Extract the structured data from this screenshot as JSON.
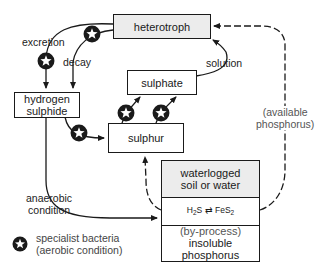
{
  "diagram": {
    "type": "sulphur cycle flow diagram",
    "nodes": {
      "heterotroph": "heterotroph",
      "sulphate": "sulphate",
      "hydrogen_sulphide_line1": "hydrogen",
      "hydrogen_sulphide_line2": "sulphide",
      "sulphur": "sulphur",
      "waterlogged_line1": "waterlogged",
      "waterlogged_line2": "soil or water",
      "equilibrium_left": "H",
      "equilibrium_left_sub": "2",
      "equilibrium_left_tail": "S",
      "equilibrium_arrow": "⇄",
      "equilibrium_right": "FeS",
      "equilibrium_right_sub": "2",
      "byprocess": "(by-process)",
      "insoluble_line1": "insoluble",
      "insoluble_line2": "phosphorus"
    },
    "edge_labels": {
      "excretion": "excretion",
      "decay": "decay",
      "solution": "solution",
      "anaerobic_line1": "anaerobic",
      "anaerobic_line2": "condition",
      "available_line1": "(available",
      "available_line2": "phosphorus)"
    },
    "legend": {
      "icon": "star-in-circle",
      "line1": "specialist bacteria",
      "line2": "(aerobic condition)"
    },
    "colors": {
      "line": "#1a1a1a",
      "box_fill_grey": "#ececec",
      "muted_text": "#555555"
    }
  }
}
